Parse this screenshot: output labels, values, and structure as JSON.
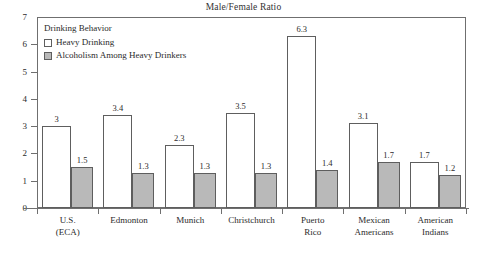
{
  "chart_data": {
    "type": "bar",
    "title": "Male/Female Ratio",
    "xlabel": "",
    "ylabel": "",
    "ylim": [
      0,
      7
    ],
    "yticks": [
      0,
      1,
      2,
      3,
      4,
      5,
      6,
      7
    ],
    "grid": false,
    "legend_position": "top-left-inside",
    "legend_title": "Drinking Behavior",
    "categories": [
      "U.S. (ECA)",
      "Edmonton",
      "Munich",
      "Christchurch",
      "Puerto Rico",
      "Mexican Americans",
      "American Indians"
    ],
    "category_lines": [
      [
        "U.S.",
        "(ECA)"
      ],
      [
        "Edmonton",
        ""
      ],
      [
        "Munich",
        ""
      ],
      [
        "Christchurch",
        ""
      ],
      [
        "Puerto",
        "Rico"
      ],
      [
        "Mexican",
        "Americans"
      ],
      [
        "American",
        "Indians"
      ]
    ],
    "series": [
      {
        "name": "Heavy Drinking",
        "color": "#ffffff",
        "values": [
          3,
          3.4,
          2.3,
          3.5,
          6.3,
          3.1,
          1.7
        ],
        "labels": [
          "3",
          "3.4",
          "2.3",
          "3.5",
          "6.3",
          "3.1",
          "1.7"
        ]
      },
      {
        "name": "Alcoholism Among Heavy Drinkers",
        "color": "#b9b9b9",
        "values": [
          1.5,
          1.3,
          1.3,
          1.3,
          1.4,
          1.7,
          1.2
        ],
        "labels": [
          "1.5",
          "1.3",
          "1.3",
          "1.3",
          "1.4",
          "1.7",
          "1.2"
        ]
      }
    ]
  },
  "axis": {
    "y_tick_labels": [
      "7",
      "6",
      "5",
      "4",
      "3",
      "2",
      "1",
      "0"
    ]
  },
  "legend": {
    "title": "Drinking Behavior",
    "items": [
      {
        "label": "Heavy Drinking",
        "swatch": "light"
      },
      {
        "label": "Alcoholism Among Heavy Drinkers",
        "swatch": "dark"
      }
    ]
  }
}
